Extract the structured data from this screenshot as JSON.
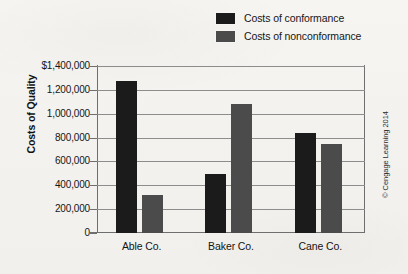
{
  "chart_data": {
    "type": "bar",
    "title": "",
    "subtitle": "",
    "xlabel": "",
    "ylabel": "Costs of Quality",
    "categories": [
      "Able Co.",
      "Baker Co.",
      "Cane Co."
    ],
    "series": [
      {
        "name": "Costs of conformance",
        "color": "#1b1b1b",
        "values": [
          1275000,
          495000,
          840000
        ]
      },
      {
        "name": "Costs of nonconformance",
        "color": "#4b4b4b",
        "values": [
          320000,
          1080000,
          750000
        ]
      }
    ],
    "ylim": [
      0,
      1400000
    ],
    "ytick_values": [
      1400000,
      1200000,
      1000000,
      800000,
      600000,
      400000,
      200000,
      0
    ],
    "ytick_labels": [
      "$1,400,000",
      "1,200,000",
      "1,000,000",
      "800,000",
      "600,000",
      "400,000",
      "200,000",
      "0"
    ],
    "grid": true,
    "grid_axis": "y",
    "legend_position": "top-right",
    "bar_orientation": "vertical",
    "group_mode": "clustered"
  },
  "legend": {
    "items": [
      {
        "label": "Costs of conformance",
        "color": "#1b1b1b"
      },
      {
        "label": "Costs of nonconformance",
        "color": "#4b4b4b"
      }
    ]
  },
  "axes": {
    "y_title": "Costs of Quality"
  },
  "footer": {
    "copyright": "© Cengage Learning 2014"
  },
  "colors": {
    "background": "#f3f2ef",
    "series_conformance": "#1b1b1b",
    "series_nonconformance": "#4b4b4b",
    "gridline": "#8d8d8d",
    "axis": "#6e6e6e",
    "text": "#141414"
  }
}
